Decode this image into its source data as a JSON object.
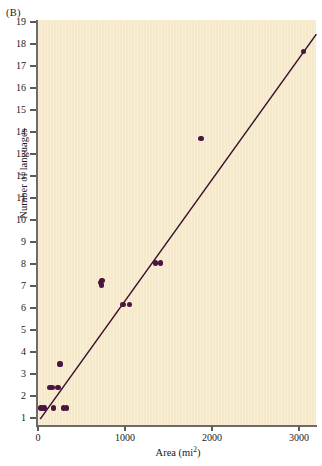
{
  "panel": {
    "label": "(B)"
  },
  "axes": {
    "xlabel_text": "Area (mi",
    "xlabel_sup": "2",
    "xlabel_close": ")",
    "xlabel_full": "Area (mi2)",
    "ylabel": "Number of languages"
  },
  "chart_data": {
    "type": "scatter",
    "title": "",
    "subtitle": "",
    "panel_label": "(B)",
    "xlabel": "Area (mi2)",
    "ylabel": "Number of languages",
    "xlim": [
      0,
      3200
    ],
    "ylim": [
      0.3,
      19
    ],
    "grid": false,
    "legend": "none",
    "xticks": [
      0,
      1000,
      2000,
      3000
    ],
    "xticklabels": [
      "0",
      "1000",
      "2000",
      "3000"
    ],
    "yticks": [
      1,
      2,
      3,
      4,
      5,
      6,
      7,
      8,
      9,
      10,
      11,
      12,
      13,
      14,
      15,
      16,
      17,
      18,
      19
    ],
    "yticklabels": [
      "1",
      "2",
      "3",
      "4",
      "5",
      "6",
      "7",
      "8",
      "9",
      "10",
      "11",
      "12",
      "13",
      "14",
      "15",
      "16",
      "17",
      "18",
      "19"
    ],
    "marker_color": "#4a1540",
    "line_color": "#3a1030",
    "plot_background": "#f6e9c9",
    "series": [
      {
        "name": "islands",
        "type": "scatter",
        "points": [
          {
            "x": 35,
            "y": 1.45
          },
          {
            "x": 60,
            "y": 1.45
          },
          {
            "x": 75,
            "y": 1.45
          },
          {
            "x": 140,
            "y": 2.4
          },
          {
            "x": 165,
            "y": 2.4
          },
          {
            "x": 180,
            "y": 1.45
          },
          {
            "x": 230,
            "y": 2.4
          },
          {
            "x": 245,
            "y": 3.45
          },
          {
            "x": 260,
            "y": 3.45
          },
          {
            "x": 290,
            "y": 1.45
          },
          {
            "x": 330,
            "y": 1.45
          },
          {
            "x": 715,
            "y": 7.15
          },
          {
            "x": 730,
            "y": 7.05
          },
          {
            "x": 735,
            "y": 7.25
          },
          {
            "x": 975,
            "y": 6.15
          },
          {
            "x": 1055,
            "y": 6.15
          },
          {
            "x": 1350,
            "y": 8.05
          },
          {
            "x": 1405,
            "y": 8.05
          },
          {
            "x": 1875,
            "y": 13.7
          },
          {
            "x": 3050,
            "y": 17.65
          }
        ]
      },
      {
        "name": "regression-line",
        "type": "line",
        "endpoints": [
          {
            "x": 25,
            "y": 0.95
          },
          {
            "x": 3200,
            "y": 18.45
          }
        ]
      }
    ]
  }
}
